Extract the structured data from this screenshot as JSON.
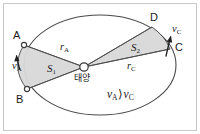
{
  "figure": {
    "background_color": "#ffffff",
    "border_color": "#c9c9c9",
    "line_color": "#4a4a4a",
    "shade_color": "#d8d8d8"
  },
  "labels": {
    "point_a": "A",
    "point_b": "B",
    "point_c": "C",
    "point_d": "D",
    "sun": "태양",
    "area_one": "S",
    "area_one_sub": "1",
    "area_two": "S",
    "area_two_sub": "2",
    "radius_a": "r",
    "radius_a_sub": "A",
    "radius_c": "r",
    "radius_c_sub": "C",
    "velocity_a": "v",
    "velocity_a_sub": "A",
    "velocity_c": "v",
    "velocity_c_sub": "C",
    "relation_left": "v",
    "relation_left_sub": "A",
    "relation_sign": "⟩",
    "relation_right": "v",
    "relation_right_sub": "C"
  },
  "geometry": {
    "ellipse_center_x": 100,
    "ellipse_center_y": 65,
    "ellipse_rx": 76,
    "ellipse_ry": 50,
    "sun_x": 84,
    "sun_y": 67,
    "point_a_x": 24,
    "point_a_y": 45,
    "point_b_x": 27,
    "point_b_y": 89,
    "point_c_x": 170,
    "point_c_y": 49,
    "point_d_x": 152,
    "point_d_y": 27
  }
}
